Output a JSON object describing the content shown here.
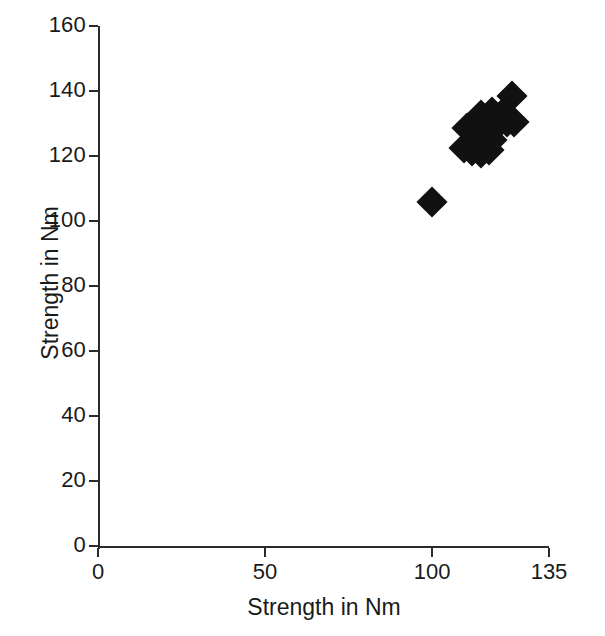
{
  "chart_data": {
    "type": "scatter",
    "title": "",
    "xlabel": "Strength in Nm",
    "ylabel": "Strength in Nm",
    "xlim": [
      0,
      135
    ],
    "ylim": [
      0,
      160
    ],
    "xticks": [
      0,
      50,
      100,
      135
    ],
    "yticks": [
      0,
      20,
      40,
      60,
      80,
      100,
      120,
      140,
      160
    ],
    "xtick_labels": [
      "0",
      "50",
      "100",
      "135"
    ],
    "ytick_labels": [
      "0",
      "20",
      "40",
      "60",
      "80",
      "100",
      "120",
      "140",
      "160"
    ],
    "grid": false,
    "legend": null,
    "marker": {
      "shape": "diamond",
      "color": "#111111",
      "size_px": 22
    },
    "series": [
      {
        "name": "measurements",
        "points": [
          {
            "x": 100.0,
            "y": 106.0
          },
          {
            "x": 124.0,
            "y": 138.5
          },
          {
            "x": 114.5,
            "y": 132.5
          },
          {
            "x": 118.0,
            "y": 133.5
          },
          {
            "x": 121.0,
            "y": 133.0
          },
          {
            "x": 110.5,
            "y": 128.5
          },
          {
            "x": 113.0,
            "y": 128.0
          },
          {
            "x": 116.5,
            "y": 128.0
          },
          {
            "x": 119.5,
            "y": 129.5
          },
          {
            "x": 122.5,
            "y": 130.5
          },
          {
            "x": 124.5,
            "y": 130.5
          },
          {
            "x": 112.5,
            "y": 124.5
          },
          {
            "x": 115.5,
            "y": 124.0
          },
          {
            "x": 118.0,
            "y": 125.0
          },
          {
            "x": 109.5,
            "y": 122.5
          },
          {
            "x": 112.0,
            "y": 121.5
          },
          {
            "x": 114.5,
            "y": 121.0
          },
          {
            "x": 117.0,
            "y": 122.0
          }
        ]
      }
    ]
  },
  "axes": {
    "x_title": "Strength in Nm",
    "y_title": "Strength in Nm"
  },
  "ticks": {
    "y": [
      {
        "value": 160,
        "label": "160"
      },
      {
        "value": 140,
        "label": "140"
      },
      {
        "value": 120,
        "label": "120"
      },
      {
        "value": 100,
        "label": "100"
      },
      {
        "value": 80,
        "label": "80"
      },
      {
        "value": 60,
        "label": "60"
      },
      {
        "value": 40,
        "label": "40"
      },
      {
        "value": 20,
        "label": "20"
      },
      {
        "value": 0,
        "label": "0"
      }
    ],
    "x": [
      {
        "value": 0,
        "label": "0"
      },
      {
        "value": 50,
        "label": "50"
      },
      {
        "value": 100,
        "label": "100"
      },
      {
        "value": 135,
        "label": "135"
      }
    ]
  }
}
